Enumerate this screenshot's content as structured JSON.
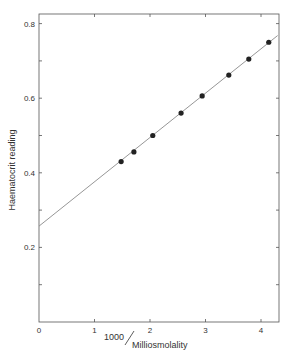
{
  "chart_data": {
    "type": "scatter",
    "title": "",
    "xlabel": "1000/Milliosmolality",
    "xlabel_parts": {
      "numerator": "1000",
      "denominator": "Milliosmolality"
    },
    "ylabel": "Haematocrit reading",
    "xlim": [
      0,
      4.3
    ],
    "ylim": [
      0,
      0.84
    ],
    "x_ticks": [
      0,
      1,
      2,
      3,
      4
    ],
    "x_tick_labels": [
      "0",
      "1",
      "2",
      "3",
      "4"
    ],
    "y_ticks": [
      0.2,
      0.4,
      0.6,
      0.8
    ],
    "y_tick_labels": [
      "0.2",
      "0.4",
      "0.6",
      "0.8"
    ],
    "grid": false,
    "legend": null,
    "series": [
      {
        "name": "measurements",
        "marker": "filled-circle",
        "x": [
          1.48,
          1.71,
          2.05,
          2.56,
          2.94,
          3.42,
          3.78,
          4.14
        ],
        "y": [
          0.43,
          0.456,
          0.5,
          0.56,
          0.606,
          0.662,
          0.705,
          0.75
        ]
      },
      {
        "name": "fit-line",
        "type": "line",
        "x": [
          0,
          4.3
        ],
        "y": [
          0.257,
          0.768
        ]
      }
    ],
    "colors": {
      "ink": "#222222",
      "line": "#888888",
      "background": "#ffffff"
    }
  }
}
